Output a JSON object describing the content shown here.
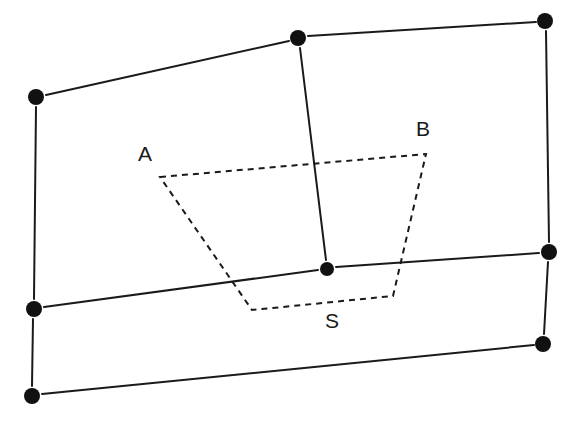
{
  "figure": {
    "width": 584,
    "height": 421,
    "background_color": "#ffffff",
    "ink_color": "#1a1a1a",
    "dot_color": "#111111"
  },
  "labels": [
    {
      "id": "label-a",
      "text": "A",
      "x": 145,
      "y": 155
    },
    {
      "id": "label-b",
      "text": "B",
      "x": 423,
      "y": 130
    },
    {
      "id": "label-s",
      "text": "S",
      "x": 332,
      "y": 322
    }
  ],
  "nodes": [
    {
      "id": "node-top-center",
      "x": 298,
      "y": 38,
      "r": 8
    },
    {
      "id": "node-top-right",
      "x": 545,
      "y": 21,
      "r": 8
    },
    {
      "id": "node-left-upper",
      "x": 36,
      "y": 97,
      "r": 8
    },
    {
      "id": "node-right-middle",
      "x": 549,
      "y": 252,
      "r": 8
    },
    {
      "id": "node-center",
      "x": 327,
      "y": 269,
      "r": 7
    },
    {
      "id": "node-left-middle",
      "x": 34,
      "y": 309,
      "r": 8
    },
    {
      "id": "node-right-lower",
      "x": 543,
      "y": 344,
      "r": 8
    },
    {
      "id": "node-left-lower",
      "x": 32,
      "y": 396,
      "r": 8
    }
  ],
  "solid_edges": [
    {
      "id": "edge-left-upper-to-top-center",
      "x1": 46,
      "y1": 95,
      "x2": 289,
      "y2": 41
    },
    {
      "id": "edge-top-center-to-top-right",
      "x1": 308,
      "y1": 36,
      "x2": 536,
      "y2": 22
    },
    {
      "id": "edge-left-upper-down",
      "x1": 36,
      "y1": 107,
      "x2": 34,
      "y2": 299
    },
    {
      "id": "edge-top-center-down-to-center",
      "x1": 300,
      "y1": 48,
      "x2": 326,
      "y2": 260
    },
    {
      "id": "edge-top-right-down",
      "x1": 546,
      "y1": 31,
      "x2": 549,
      "y2": 242
    },
    {
      "id": "edge-left-middle-to-center",
      "x1": 44,
      "y1": 307,
      "x2": 318,
      "y2": 270
    },
    {
      "id": "edge-center-to-right-middle",
      "x1": 336,
      "y1": 267,
      "x2": 539,
      "y2": 253
    },
    {
      "id": "edge-left-middle-down",
      "x1": 33,
      "y1": 319,
      "x2": 32,
      "y2": 386
    },
    {
      "id": "edge-right-middle-down",
      "x1": 548,
      "y1": 262,
      "x2": 544,
      "y2": 334
    },
    {
      "id": "edge-left-lower-to-right-lower",
      "x1": 42,
      "y1": 394,
      "x2": 534,
      "y2": 345
    }
  ],
  "dashed_polygon": {
    "id": "inner-quadrilateral",
    "points": [
      {
        "name": "A",
        "x": 160,
        "y": 177
      },
      {
        "name": "B",
        "x": 426,
        "y": 154
      },
      {
        "name": "C",
        "x": 393,
        "y": 296
      },
      {
        "name": "D",
        "x": 252,
        "y": 310
      }
    ]
  }
}
